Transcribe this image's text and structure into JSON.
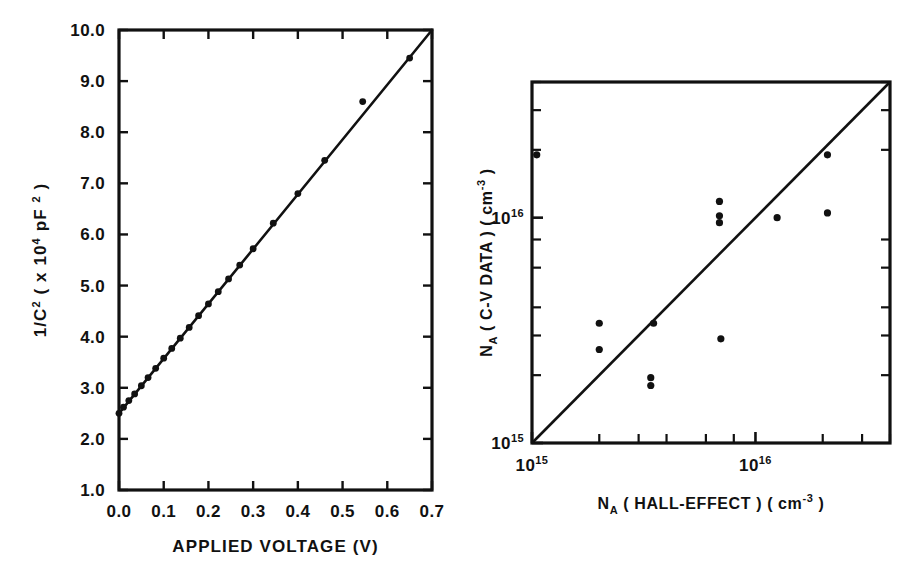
{
  "figure": {
    "background": "#ffffff",
    "ink": "#111111"
  },
  "chart_data": [
    {
      "id": "cv-plot",
      "type": "line",
      "title": "",
      "xlabel": "APPLIED VOLTAGE  (V)",
      "ylabel": "1/C² ( x 10⁴ pF ² )",
      "ylabel_parts": {
        "lead": "1/C",
        "lead_sup": "2",
        "mid": " ( x 10",
        "mid_sup": "4",
        "tail": " pF ",
        "tail_sup": "2",
        "close": " )"
      },
      "xlim": [
        0.0,
        0.7
      ],
      "ylim": [
        1.0,
        10.0
      ],
      "xscale": "linear",
      "yscale": "linear",
      "grid": false,
      "legend": "none",
      "xticks": [
        0.0,
        0.1,
        0.2,
        0.3,
        0.4,
        0.5,
        0.6,
        0.7
      ],
      "xticklabels": [
        "0.0",
        "0.1",
        "0.2",
        "0.3",
        "0.4",
        "0.5",
        "0.6",
        "0.7"
      ],
      "yticks": [
        1.0,
        2.0,
        3.0,
        4.0,
        5.0,
        6.0,
        7.0,
        8.0,
        9.0,
        10.0
      ],
      "yticklabels": [
        "1.0",
        "2.0",
        "3.0",
        "4.0",
        "5.0",
        "6.0",
        "7.0",
        "8.0",
        "9.0",
        "10.0"
      ],
      "fit_line": {
        "x": [
          0.0,
          0.7
        ],
        "y": [
          2.5,
          10.0
        ],
        "intercept": 2.5,
        "slope": 10.71
      },
      "x": [
        0.0,
        0.01,
        0.022,
        0.035,
        0.05,
        0.065,
        0.082,
        0.1,
        0.118,
        0.137,
        0.157,
        0.178,
        0.2,
        0.222,
        0.245,
        0.27,
        0.3,
        0.345,
        0.4,
        0.46,
        0.545,
        0.65
      ],
      "y": [
        2.5,
        2.62,
        2.75,
        2.88,
        3.04,
        3.2,
        3.38,
        3.58,
        3.77,
        3.97,
        4.18,
        4.41,
        4.64,
        4.88,
        5.13,
        5.4,
        5.72,
        6.22,
        6.8,
        7.45,
        8.6,
        9.45
      ],
      "marker": "filled-circle",
      "outlier_note": "last point at (0.65, 9.45) lies slightly below the fit line"
    },
    {
      "id": "na-comparison-plot",
      "type": "scatter",
      "title": "",
      "xlabel": "Nₐ (HALL-EFFECT) (cm⁻³)",
      "ylabel": "Nₐ (C-V DATA) (cm⁻³)",
      "xlabel_parts": {
        "lead": "N",
        "lead_sub": "A",
        "mid": " ( HALL-EFFECT ) ( cm",
        "sup": "-3",
        "close": " )"
      },
      "ylabel_parts": {
        "lead": "N",
        "lead_sub": "A",
        "mid": " ( C-V DATA ) ( cm",
        "sup": "-3",
        "close": " )"
      },
      "xscale": "log",
      "yscale": "log",
      "xlim": [
        1000000000000000.0,
        4e+16
      ],
      "ylim": [
        1000000000000000.0,
        4e+16
      ],
      "grid": false,
      "legend": "none",
      "xticks_major": [
        1000000000000000.0,
        1e+16
      ],
      "xticklabels": [
        "10¹⁵",
        "10¹⁶"
      ],
      "xtick_exponents": [
        "15",
        "16"
      ],
      "yticks_major": [
        1000000000000000.0,
        1e+16
      ],
      "yticklabels": [
        "10¹⁵",
        "10¹⁶"
      ],
      "ytick_exponents": [
        "15",
        "16"
      ],
      "unity_line": {
        "x": [
          1000000000000000.0,
          4e+16
        ],
        "y": [
          1000000000000000.0,
          4e+16
        ],
        "label": "1:1 line"
      },
      "points": [
        {
          "x": 1050000000000000.0,
          "y": 1.9e+16
        },
        {
          "x": 2000000000000000.0,
          "y": 3400000000000000.0
        },
        {
          "x": 2000000000000000.0,
          "y": 2600000000000000.0
        },
        {
          "x": 3400000000000000.0,
          "y": 1950000000000000.0
        },
        {
          "x": 3400000000000000.0,
          "y": 1800000000000000.0
        },
        {
          "x": 3500000000000000.0,
          "y": 3400000000000000.0
        },
        {
          "x": 6900000000000000.0,
          "y": 1.18e+16
        },
        {
          "x": 6900000000000000.0,
          "y": 1.02e+16
        },
        {
          "x": 6900000000000000.0,
          "y": 9500000000000000.0
        },
        {
          "x": 7000000000000000.0,
          "y": 2900000000000000.0
        },
        {
          "x": 1.25e+16,
          "y": 1e+16
        },
        {
          "x": 2.1e+16,
          "y": 1.9e+16
        },
        {
          "x": 2.1e+16,
          "y": 1.05e+16
        }
      ],
      "marker": "filled-circle"
    }
  ]
}
